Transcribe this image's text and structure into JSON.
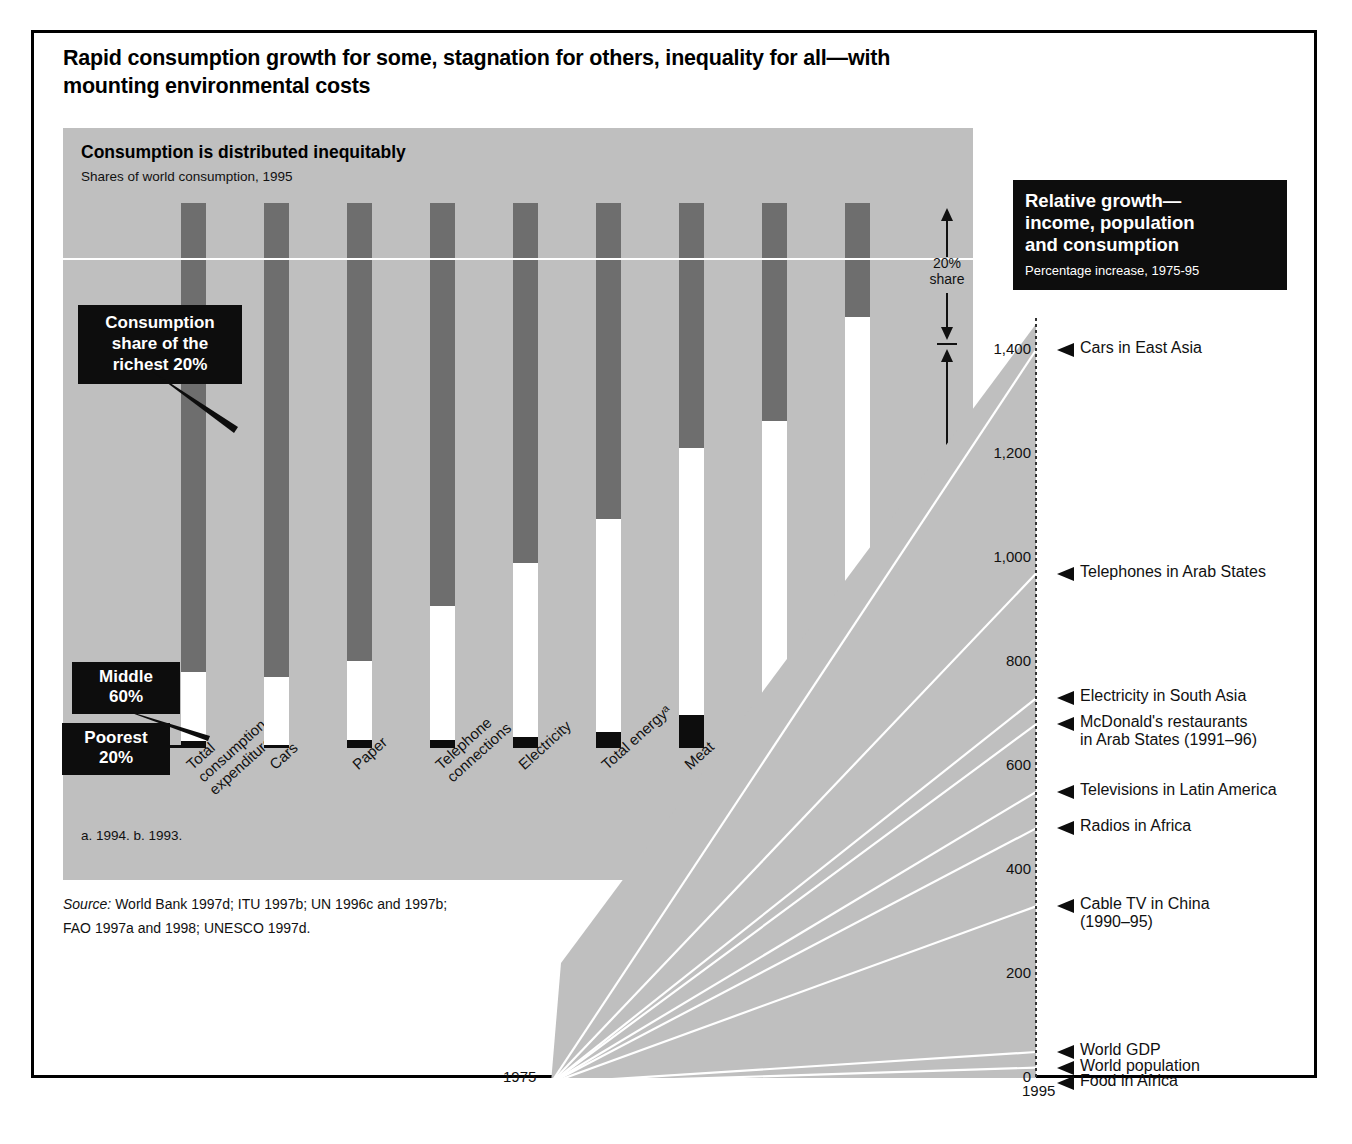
{
  "title": "Rapid consumption growth for some, stagnation for others, inequality for all—with mounting environmental costs",
  "left_panel": {
    "heading": "Consumption is distributed inequitably",
    "subheading": "Shares of world consumption, 1995",
    "footnote": "a. 1994.   b. 1993.",
    "source_line1_label": "Source:",
    "source_line1": " World Bank 1997d; ITU 1997b; UN 1996c and 1997b;",
    "source_line2": "FAO 1997a and 1998; UNESCO 1997d.",
    "callouts": [
      {
        "id": "richest",
        "text": "Consumption\nshare of the\nrichest 20%"
      },
      {
        "id": "middle",
        "text": "Middle\n60%"
      },
      {
        "id": "poorest",
        "text": "Poorest\n20%"
      }
    ],
    "share_brackets": [
      {
        "id": "top",
        "label": "20%\nshare"
      },
      {
        "id": "mid",
        "label": "60%\nshare"
      },
      {
        "id": "bot",
        "label": "20%\nshare"
      }
    ]
  },
  "right_panel": {
    "heading": "Relative growth—\nincome, population\nand consumption",
    "subheading": "Percentage increase, 1975-95",
    "start_year": "1975",
    "end_year": "1995"
  },
  "colors": {
    "richest": "#6e6e6e",
    "middle": "#ffffff",
    "poorest": "#0d0d0d",
    "panel_bg": "#bfbfbf",
    "callout_bg": "#0d0d0d",
    "frame": "#000000"
  },
  "chart_data": [
    {
      "type": "bar",
      "id": "consumption-shares",
      "title": "Consumption is distributed inequitably",
      "subtitle": "Shares of world consumption, 1995",
      "xlabel": "",
      "ylabel": "",
      "ylim": [
        0,
        100
      ],
      "grid": false,
      "stacked": true,
      "categories": [
        "Total\nconsumption\nexpenditure",
        "Cars",
        "Paper",
        "Telephone\nconnections",
        "Electricity",
        "Total energyᵃ",
        "Meat",
        "Fishᵇ",
        "Cereals"
      ],
      "series": [
        {
          "name": "Richest 20%",
          "color": "#6e6e6e",
          "values": [
            86,
            87,
            84,
            74,
            66,
            58,
            45,
            40,
            21
          ]
        },
        {
          "name": "Middle 60%",
          "color": "#ffffff",
          "values": [
            12.7,
            12.5,
            14.5,
            24.5,
            32,
            39,
            49,
            52,
            55
          ]
        },
        {
          "name": "Poorest 20%",
          "color": "#0d0d0d",
          "values": [
            1.3,
            0.5,
            1.5,
            1.5,
            2,
            3,
            6,
            8,
            24
          ]
        }
      ],
      "annotations": [
        "20% share (top band)",
        "60% share (middle band)",
        "20% share (bottom band)"
      ],
      "footnotes": [
        "a. 1994.",
        "b. 1993."
      ],
      "source": "World Bank 1997d; ITU 1997b; UN 1996c and 1997b; FAO 1997a and 1998; UNESCO 1997d."
    },
    {
      "type": "line",
      "id": "relative-growth",
      "title": "Relative growth—income, population and consumption",
      "subtitle": "Percentage increase, 1975-95",
      "xlabel": "",
      "ylabel": "",
      "x": [
        "1975",
        "1995"
      ],
      "ylim": [
        0,
        1450
      ],
      "yticks": [
        0,
        200,
        400,
        600,
        800,
        1000,
        1200,
        1400
      ],
      "ytick_labels": [
        "0",
        "200",
        "400",
        "600",
        "800",
        "1,000",
        "1,200",
        "1,400"
      ],
      "grid": false,
      "legend": "none",
      "series": [
        {
          "name": "Cars in East Asia",
          "end_value": 1400,
          "label": "Cars in East Asia"
        },
        {
          "name": "Telephones in Arab States",
          "end_value": 970,
          "label": "Telephones in Arab States"
        },
        {
          "name": "Electricity in South Asia",
          "end_value": 730,
          "label": "Electricity in South Asia"
        },
        {
          "name": "McDonald's restaurants in Arab States (1991–96)",
          "end_value": 680,
          "label": "McDonald's restaurants",
          "label2": "in Arab States (1991–96)"
        },
        {
          "name": "Televisions in Latin America",
          "end_value": 550,
          "label": "Televisions in Latin America"
        },
        {
          "name": "Radios in Africa",
          "end_value": 480,
          "label": "Radios in Africa"
        },
        {
          "name": "Cable TV in China (1990–95)",
          "end_value": 330,
          "label": "Cable TV in China",
          "label2": "(1990–95)"
        },
        {
          "name": "World GDP",
          "end_value": 50,
          "label": "World GDP"
        },
        {
          "name": "World population",
          "end_value": 20,
          "label": "World population"
        },
        {
          "name": "Food in Africa",
          "end_value": -10,
          "label": "Food in Africa"
        }
      ]
    }
  ]
}
